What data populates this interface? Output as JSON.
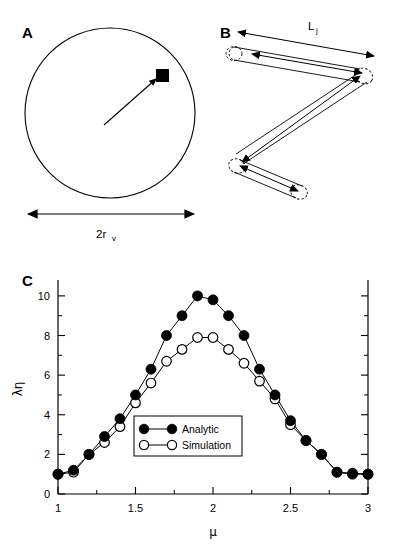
{
  "figure": {
    "panels": [
      {
        "id": "A",
        "label": "A",
        "caption_label": "2r",
        "caption_sub": "v"
      },
      {
        "id": "B",
        "label": "B",
        "length_label": "L",
        "length_sub": "j"
      },
      {
        "id": "C",
        "label": "C"
      }
    ]
  },
  "panel_a": {
    "label": "A",
    "diameter_label_main": "2r",
    "diameter_label_sub": "v"
  },
  "panel_b": {
    "label": "B",
    "segment_label_main": "L",
    "segment_label_sub": "j"
  },
  "panel_c": {
    "label": "C"
  },
  "chart_data": {
    "type": "line",
    "title": "",
    "xlabel": "μ",
    "ylabel": "λη",
    "xlim": [
      1,
      3
    ],
    "ylim": [
      0,
      10.6
    ],
    "xticks": [
      1,
      1.5,
      2,
      2.5,
      3
    ],
    "xtick_labels": [
      "1",
      "1.5",
      "2",
      "2.5",
      "3"
    ],
    "xminor_ticks": [
      1.25,
      1.75,
      2.25,
      2.75
    ],
    "yticks": [
      0,
      2,
      4,
      6,
      8,
      10
    ],
    "ytick_labels": [
      "0",
      "2",
      "4",
      "6",
      "8",
      "10"
    ],
    "yminor_ticks": [
      1,
      3,
      5,
      7,
      9
    ],
    "grid": false,
    "legend_position": "center",
    "x": [
      1.0,
      1.1,
      1.2,
      1.3,
      1.4,
      1.5,
      1.6,
      1.7,
      1.8,
      1.9,
      2.0,
      2.1,
      2.2,
      2.3,
      2.4,
      2.5,
      2.6,
      2.7,
      2.8,
      2.9,
      3.0
    ],
    "series": [
      {
        "name": "Analytic",
        "marker": "filled-circle",
        "values": [
          1.0,
          1.2,
          2.0,
          2.9,
          3.8,
          5.0,
          6.3,
          8.0,
          9.0,
          10.0,
          9.8,
          9.0,
          8.0,
          6.3,
          5.0,
          3.7,
          2.7,
          2.0,
          1.1,
          1.0,
          1.0
        ]
      },
      {
        "name": "Simulation",
        "marker": "open-circle",
        "values": [
          1.0,
          1.1,
          2.0,
          2.6,
          3.4,
          4.6,
          5.6,
          6.7,
          7.3,
          7.9,
          7.9,
          7.3,
          6.6,
          5.7,
          4.8,
          3.5,
          2.7,
          2.0,
          1.1,
          1.05,
          1.0
        ]
      }
    ],
    "legend": [
      {
        "label": "Analytic",
        "marker": "filled-circle"
      },
      {
        "label": "Simulation",
        "marker": "open-circle"
      }
    ]
  },
  "colors": {
    "ink": "#000000",
    "background": "#ffffff",
    "marker_fill_analytic": "#000000",
    "marker_fill_simulation": "#ffffff"
  }
}
